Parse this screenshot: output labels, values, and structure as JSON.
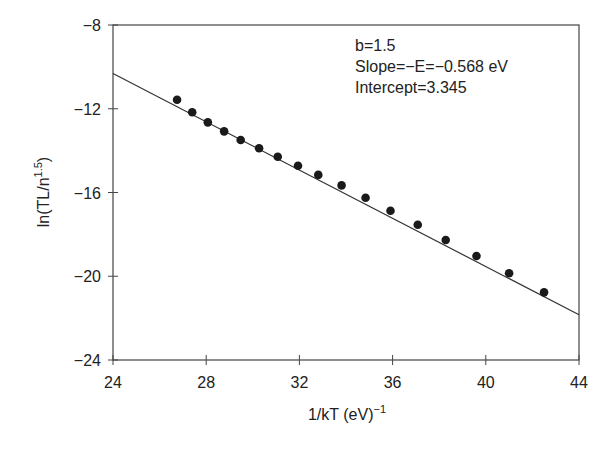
{
  "chart_data": {
    "type": "scatter",
    "title": "",
    "xlabel": "1/kT  (eV)^-1",
    "xlabel_main": "1/kT  (eV)",
    "xlabel_sup": "−1",
    "ylabel": "ln(TL/n^1.5)",
    "ylabel_main": "ln(TL/n",
    "ylabel_sup": "1.5",
    "ylabel_close": ")",
    "xlim": [
      24,
      44
    ],
    "ylim": [
      -24,
      -8
    ],
    "grid": false,
    "legend": null,
    "x_ticks": [
      24,
      28,
      32,
      36,
      40,
      44
    ],
    "x_tick_labels": [
      "24",
      "28",
      "32",
      "36",
      "40",
      "44"
    ],
    "y_ticks": [
      -8,
      -12,
      -16,
      -20,
      -24
    ],
    "y_tick_labels": [
      "−8",
      "−12",
      "−16",
      "−20",
      "−24"
    ],
    "annotations": [
      "b=1.5",
      "Slope=−E=−0.568 eV",
      "Intercept=3.345"
    ],
    "series": [
      {
        "name": "data",
        "style": "marker",
        "x": [
          26.75,
          27.4,
          28.07,
          28.77,
          29.48,
          30.27,
          31.07,
          31.94,
          32.81,
          33.81,
          34.84,
          35.91,
          37.08,
          38.28,
          39.6,
          41.0,
          42.5
        ],
        "y": [
          -11.57,
          -12.17,
          -12.65,
          -13.08,
          -13.49,
          -13.89,
          -14.29,
          -14.72,
          -15.16,
          -15.66,
          -16.25,
          -16.87,
          -17.54,
          -18.27,
          -19.03,
          -19.86,
          -20.77
        ]
      },
      {
        "name": "linear fit",
        "style": "line",
        "x": [
          24,
          44
        ],
        "y": [
          -10.32,
          -21.84
        ]
      }
    ],
    "colors": {
      "marker": "#1a1a1a",
      "line": "#333333",
      "axis": "#444444"
    }
  }
}
